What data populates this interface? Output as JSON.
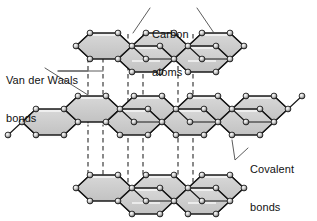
{
  "figure": {
    "background_color": "#ffffff"
  },
  "labels": [
    {
      "id": "carbon-atoms",
      "name": "carbon-atoms-label",
      "line1": "Carbon",
      "line2": "atoms",
      "text": "Carbon atoms",
      "x": 152,
      "y": 3,
      "align": "left",
      "leaders": 2
    },
    {
      "id": "van-der-waals-bonds",
      "name": "van-der-waals-bonds-label",
      "line1": "Van der Waals",
      "line2": "bonds",
      "text": "Van der Waals bonds",
      "x": 6,
      "y": 49,
      "align": "left",
      "leaders": 2
    },
    {
      "id": "covalent-bonds",
      "name": "covalent-bonds-label",
      "line1": "Covalent",
      "line2": "bonds",
      "text": "Covalent bonds",
      "x": 250,
      "y": 138,
      "align": "left",
      "leaders": 1
    }
  ],
  "structure": {
    "layer_count": 3,
    "layers": [
      {
        "id": "top-layer",
        "name": "graphene-layer-top",
        "y_center": 48,
        "x_span": [
          68,
          262
        ],
        "hexagons": 5
      },
      {
        "id": "middle-layer",
        "name": "graphene-layer-middle",
        "y_center": 122,
        "x_span": [
          14,
          306
        ],
        "hexagons": 8
      },
      {
        "id": "bottom-layer",
        "name": "graphene-layer-bottom",
        "y_center": 190,
        "x_span": [
          68,
          262
        ],
        "hexagons": 5
      }
    ],
    "interlayer_guides": {
      "name": "van-der-waals-dashed-guides",
      "count": 6,
      "x_positions": [
        88,
        103,
        128,
        143,
        178,
        193
      ],
      "y_top": 34,
      "y_bottom": 202,
      "style": "dashed"
    }
  },
  "style": {
    "face_fill": "#c9c9c9",
    "face_fill_light": "#d6d6d6",
    "bond_stroke": "#1a1a1a",
    "bond_highlight": "#f2f2f2",
    "atom_fill": "#e8e8e8",
    "atom_stroke": "#141414",
    "guide_stroke": "#2b2b2b",
    "leader_stroke": "#4a4a4a",
    "text_color": "#111111"
  }
}
